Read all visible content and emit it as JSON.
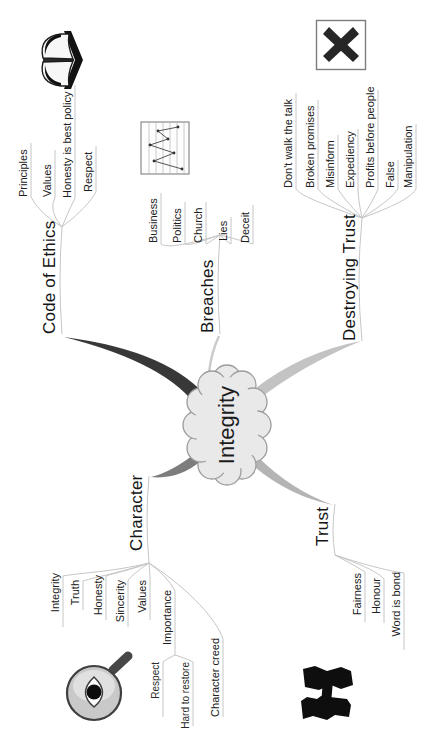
{
  "map": {
    "center": "Integrity",
    "code_of_ethics": {
      "label": "Code of Ethics",
      "items": {
        "principles": "Principles",
        "values": "Values",
        "honesty": "Honesty is best policy",
        "respect": "Respect"
      }
    },
    "breaches": {
      "label": "Breaches",
      "items": {
        "business": "Business",
        "politics": "Politics",
        "church": "Church",
        "lies": "Lies",
        "deceit": "Deceit"
      }
    },
    "destroying_trust": {
      "label": "Destroying Trust",
      "items": {
        "dont_walk": "Don't walk the talk",
        "broken": "Broken promises",
        "misinform": "Misinform",
        "expediency": "Expediency",
        "profits": "Profits before people",
        "false": "False",
        "manipulation": "Manipulation"
      }
    },
    "character": {
      "label": "Character",
      "items": {
        "integrity": "Integrity",
        "truth": "Truth",
        "honesty": "Honesty",
        "sincerity": "Sincerity",
        "values": "Values",
        "importance": "Importance",
        "creed": "Character creed"
      },
      "importance_items": {
        "respect": "Respect",
        "hard": "Hard to restore"
      }
    },
    "trust": {
      "label": "Trust",
      "items": {
        "fairness": "Fairness",
        "honour": "Honour",
        "word": "Word is bond"
      }
    }
  },
  "icons": {
    "book": "open-book",
    "chart": "line-chart",
    "cross": "crossed-out-x",
    "magnifier": "eye-magnifier",
    "handshake": "handshake"
  },
  "colors": {
    "branch_code": "#383838",
    "branch_character": "#7d7d7d",
    "branch_trust": "#b4b4b4",
    "branch_destroying": "#c3c3c3",
    "branch_breaches": "#cbcbcb",
    "connector": "#c6c6c6",
    "cloud_fill": "#e9e9e9",
    "cloud_stroke": "#9c9c9c",
    "text": "#1a1a1a"
  }
}
